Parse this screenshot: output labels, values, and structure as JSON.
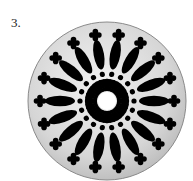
{
  "figure": {
    "label": "3.",
    "colors": {
      "disc": "#d9d9d9",
      "disc_edge": "#8a8a8a",
      "cutout": "#000000"
    },
    "center": [
      107,
      101
    ],
    "radius": 79,
    "outer_crosses": 18,
    "petals": 18,
    "dots": 18,
    "inner_spokes": 36
  }
}
